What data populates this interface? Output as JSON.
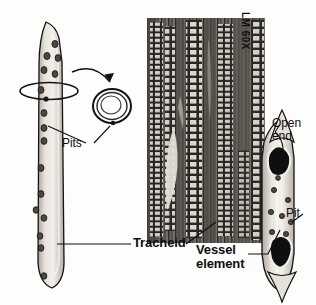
{
  "figure": {
    "background_color": "#fdfdfc"
  },
  "micrograph": {
    "magnification_label": "LM 60X",
    "description": "light micrograph of xylem tissue in longitudinal section",
    "bounds": {
      "x": 147,
      "y": 18,
      "width": 118,
      "height": 225
    }
  },
  "labels": {
    "tracheid": "Tracheid",
    "vessel_element": "Vessel\nelement",
    "pits": "Pits",
    "open_end": "Open\nend",
    "pit": "Pit"
  },
  "cells": {
    "tracheid": {
      "name": "Tracheid",
      "shape": "elongated tapered cell with pointed ends",
      "pit_count": 16,
      "fill_color": "#d9d6cf",
      "outline_color": "#1a1a1a"
    },
    "vessel_element": {
      "name": "Vessel element",
      "shape": "barrel shaped cell with open perforation plates at both ends",
      "pit_count": 8,
      "open_end_count": 2,
      "fill_color": "#ddd9d2",
      "outline_color": "#1a1a1a",
      "open_end_color": "#121212"
    },
    "pit_detail": {
      "name": "Pit detail",
      "shape": "concentric rings showing pit annulus",
      "ring_count": 3
    }
  },
  "colors": {
    "ink": "#0d0d0d",
    "cell_fill": "#d9d6cf",
    "cell_shadow": "#a9a49b",
    "pit_fill": "#4a4540",
    "leader_line": "#111111"
  }
}
